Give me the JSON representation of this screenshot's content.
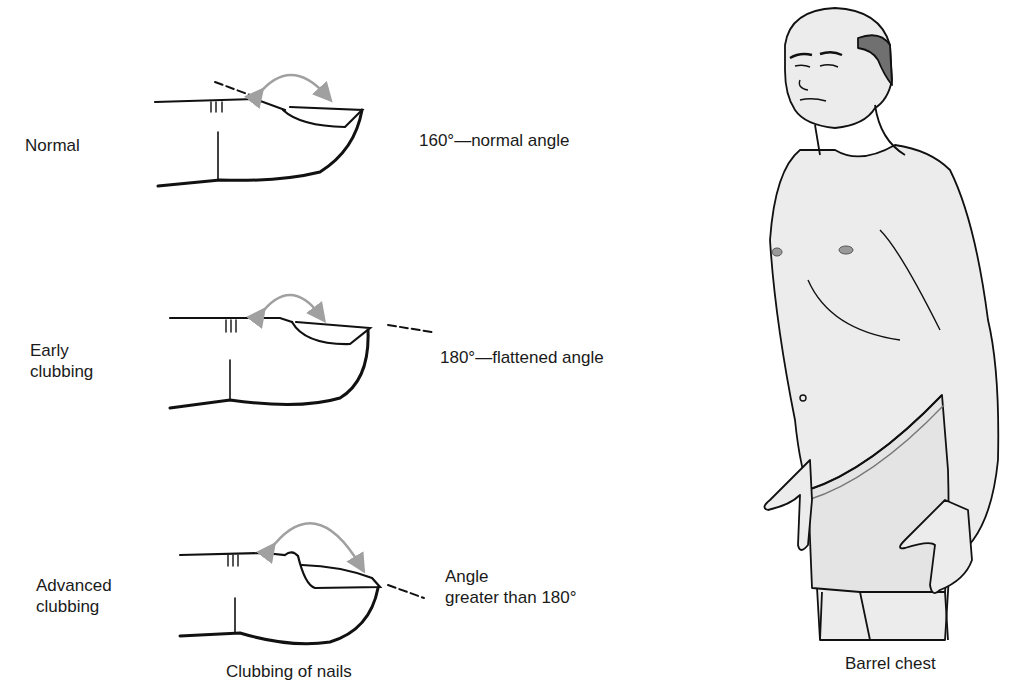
{
  "figure": {
    "left_panel": {
      "caption": "Clubbing of nails",
      "stages": [
        {
          "name": "Normal",
          "label_lines": [
            "Normal"
          ],
          "angle_text_lines": [
            "160°—normal angle"
          ]
        },
        {
          "name": "Early clubbing",
          "label_lines": [
            "Early",
            "clubbing"
          ],
          "angle_text_lines": [
            "180°—flattened angle"
          ]
        },
        {
          "name": "Advanced clubbing",
          "label_lines": [
            "Advanced",
            "clubbing"
          ],
          "angle_text_lines": [
            "Angle",
            "greater than 180°"
          ]
        }
      ]
    },
    "right_panel": {
      "caption": "Barrel chest"
    },
    "colors": {
      "line": "#111111",
      "arrow": "#a0a0a0",
      "skin": "#ececec",
      "hair": "#707070",
      "nipple": "#9a9a9a",
      "background": "#ffffff"
    }
  }
}
